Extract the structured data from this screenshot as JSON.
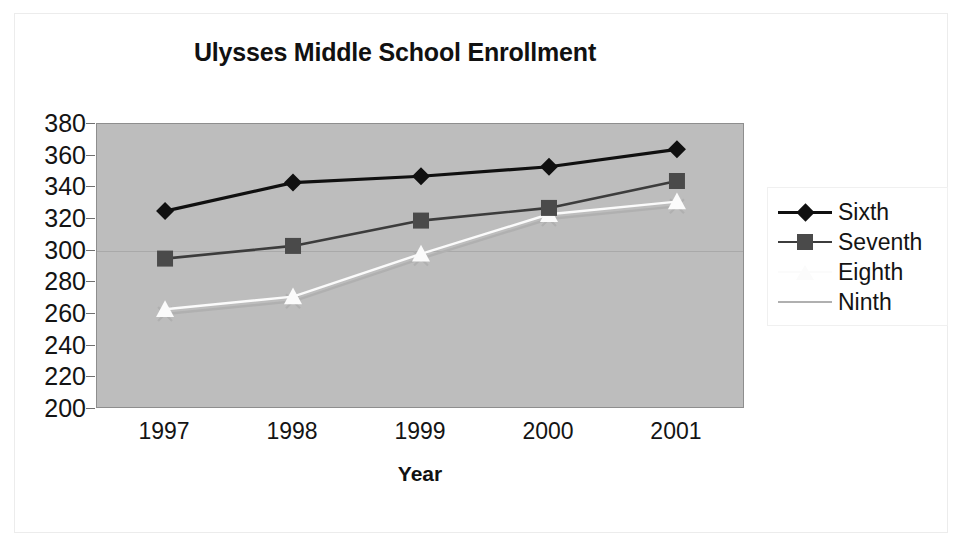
{
  "chart_data": {
    "type": "line",
    "title": "Ulysses Middle School Enrollment",
    "xlabel": "Year",
    "ylabel": "",
    "categories": [
      "1997",
      "1998",
      "1999",
      "2000",
      "2001"
    ],
    "ylim": [
      200,
      380
    ],
    "ytick_step": 20,
    "yticks": [
      "380",
      "360",
      "340",
      "320",
      "300",
      "280",
      "260",
      "240",
      "220",
      "200"
    ],
    "grid": false,
    "legend_position": "right",
    "series": [
      {
        "name": "Sixth",
        "marker": "diamond",
        "color": "#101010",
        "line_color": "#101010",
        "values": [
          325,
          343,
          347,
          353,
          364
        ]
      },
      {
        "name": "Seventh",
        "marker": "square",
        "color": "#4a4a4a",
        "line_color": "#3c3c3c",
        "values": [
          295,
          303,
          319,
          327,
          344
        ]
      },
      {
        "name": "Eighth",
        "marker": "triangle",
        "color": "#fbfbfb",
        "line_color": "#fbfbfb",
        "values": [
          263,
          271,
          298,
          323,
          331
        ]
      },
      {
        "name": "Ninth",
        "marker": "x",
        "color": "#b0b0b0",
        "line_color": "#b0b0b0",
        "values": [
          260,
          268,
          295,
          320,
          328
        ]
      }
    ]
  },
  "legend": {
    "items": [
      {
        "label": "Sixth"
      },
      {
        "label": "Seventh"
      },
      {
        "label": "Eighth"
      },
      {
        "label": "Ninth"
      }
    ]
  },
  "colors": {
    "plot_background": "#bdbdbd",
    "plot_border": "#8e8e8e",
    "page_background": "#ffffff",
    "text": "#141414"
  }
}
